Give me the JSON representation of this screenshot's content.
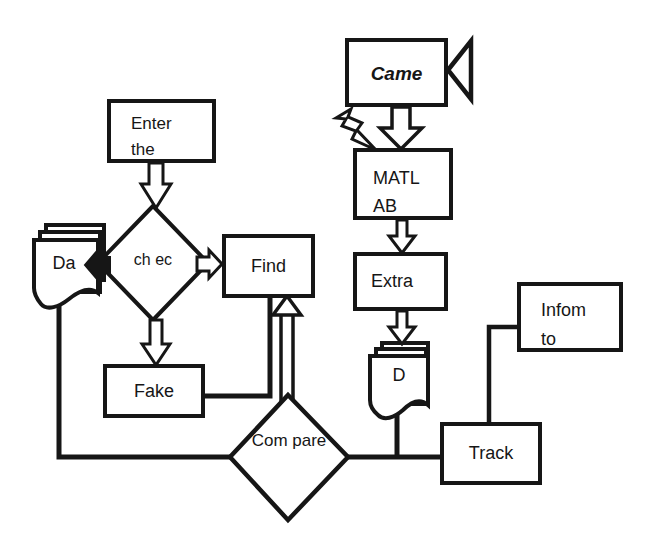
{
  "diagram": {
    "type": "flowchart",
    "colors": {
      "stroke": "#161616",
      "node_fill": "#ffffff",
      "background": "#ffffff"
    },
    "nodes": {
      "enter": {
        "line1": "Enter",
        "line2": "the"
      },
      "came": {
        "label": "Came"
      },
      "matlab": {
        "line1": "MATL",
        "line2": "AB"
      },
      "extra": {
        "label": "Extra"
      },
      "find": {
        "label": "Find"
      },
      "check": {
        "line1": "ch",
        "line2": "ec"
      },
      "fake": {
        "label": "Fake"
      },
      "da_document": {
        "label": "Da"
      },
      "d_document": {
        "label": "D"
      },
      "compare": {
        "line1": "Com",
        "line2": "pare"
      },
      "inform": {
        "line1": "Infom",
        "line2": "to"
      },
      "track": {
        "label": "Track"
      }
    },
    "icons": {
      "camera": "video-camera-icon",
      "lightning": "lightning-bolt-icon"
    }
  }
}
